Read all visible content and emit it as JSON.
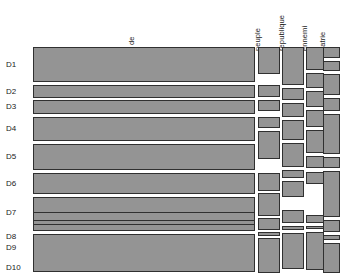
{
  "chart_data": {
    "type": "mosaic",
    "title": "",
    "subtitle": "",
    "xlabel": "",
    "ylabel": "",
    "grid": false,
    "legend": "none",
    "note": "Mosaic / marimekko style plot: column widths proportional to total word frequency; within each column, cell heights proportional to the frequency of that word in each document (D1..D10). Values are estimated from pixel geometry.",
    "row_categories": [
      "D1",
      "D2",
      "D3",
      "D4",
      "D5",
      "D6",
      "D7",
      "D8",
      "D9",
      "D10"
    ],
    "column_categories": [
      "de",
      "peuple",
      "republique",
      "ennemi",
      "patrie"
    ],
    "column_widths_px": [
      222,
      22,
      22,
      18,
      18
    ],
    "plot_area": {
      "x": 33,
      "y": 46,
      "width": 307,
      "height": 230
    },
    "series": [
      {
        "name": "de",
        "x": 33,
        "width": 222,
        "values": [
          33,
          12,
          14,
          23,
          25,
          20,
          31,
          9,
          7,
          37
        ],
        "cells": [
          {
            "row": "D1",
            "y": 47,
            "height": 35
          },
          {
            "row": "D2",
            "y": 85,
            "height": 13
          },
          {
            "row": "D3",
            "y": 100,
            "height": 14
          },
          {
            "row": "D4",
            "y": 117,
            "height": 24
          },
          {
            "row": "D5",
            "y": 144,
            "height": 26
          },
          {
            "row": "D6",
            "y": 173,
            "height": 21
          },
          {
            "row": "D7",
            "y": 197,
            "height": 32
          },
          {
            "row": "D8",
            "y": 212,
            "height": 9
          },
          {
            "row": "D9",
            "y": 224,
            "height": 7
          },
          {
            "row": "D10",
            "y": 234,
            "height": 38
          }
        ]
      },
      {
        "name": "peuple",
        "x": 258,
        "width": 22,
        "values": [
          26,
          11,
          10,
          10,
          27,
          17,
          22,
          11,
          3,
          33
        ],
        "cells": [
          {
            "row": "D1",
            "y": 47,
            "height": 27
          },
          {
            "row": "D2",
            "y": 85,
            "height": 12
          },
          {
            "row": "D3",
            "y": 100,
            "height": 11
          },
          {
            "row": "D4",
            "y": 117,
            "height": 11
          },
          {
            "row": "D5",
            "y": 131,
            "height": 28
          },
          {
            "row": "D6",
            "y": 173,
            "height": 18
          },
          {
            "row": "D7",
            "y": 193,
            "height": 23
          },
          {
            "row": "D8",
            "y": 218,
            "height": 12
          },
          {
            "row": "D9",
            "y": 232,
            "height": 4
          },
          {
            "row": "D10",
            "y": 238,
            "height": 35
          }
        ]
      },
      {
        "name": "republique",
        "x": 282,
        "width": 22,
        "values": [
          36,
          11,
          13,
          19,
          23,
          7,
          15,
          12,
          3,
          34
        ],
        "cells": [
          {
            "row": "D1",
            "y": 47,
            "height": 38
          },
          {
            "row": "D2",
            "y": 88,
            "height": 12
          },
          {
            "row": "D3",
            "y": 103,
            "height": 14
          },
          {
            "row": "D4",
            "y": 120,
            "height": 20
          },
          {
            "row": "D5",
            "y": 143,
            "height": 24
          },
          {
            "row": "D6",
            "y": 170,
            "height": 8
          },
          {
            "row": "D7",
            "y": 181,
            "height": 16
          },
          {
            "row": "D8",
            "y": 210,
            "height": 13
          },
          {
            "row": "D9",
            "y": 226,
            "height": 4
          },
          {
            "row": "D10",
            "y": 233,
            "height": 36
          }
        ]
      },
      {
        "name": "ennemi",
        "x": 306,
        "width": 18,
        "values": [
          22,
          14,
          15,
          16,
          22,
          11,
          11,
          7,
          2,
          36
        ],
        "cells": [
          {
            "row": "D1",
            "y": 47,
            "height": 23
          },
          {
            "row": "D2",
            "y": 73,
            "height": 15
          },
          {
            "row": "D3",
            "y": 91,
            "height": 16
          },
          {
            "row": "D4",
            "y": 110,
            "height": 17
          },
          {
            "row": "D5",
            "y": 130,
            "height": 23
          },
          {
            "row": "D6",
            "y": 156,
            "height": 12
          },
          {
            "row": "D7",
            "y": 172,
            "height": 12
          },
          {
            "row": "D8",
            "y": 215,
            "height": 8
          },
          {
            "row": "D9",
            "y": 226,
            "height": 3
          },
          {
            "row": "D10",
            "y": 232,
            "height": 38
          }
        ]
      },
      {
        "name": "patrie",
        "x": 323,
        "width": 17,
        "values": [
          10,
          9,
          20,
          12,
          38,
          10,
          44,
          11,
          4,
          28
        ],
        "cells": [
          {
            "row": "D1",
            "y": 47,
            "height": 11
          },
          {
            "row": "D2",
            "y": 61,
            "height": 10
          },
          {
            "row": "D3",
            "y": 74,
            "height": 21
          },
          {
            "row": "D4",
            "y": 98,
            "height": 13
          },
          {
            "row": "D5",
            "y": 114,
            "height": 40
          },
          {
            "row": "D6",
            "y": 157,
            "height": 11
          },
          {
            "row": "D7",
            "y": 171,
            "height": 46
          },
          {
            "row": "D8",
            "y": 220,
            "height": 12
          },
          {
            "row": "D9",
            "y": 235,
            "height": 5
          },
          {
            "row": "D10",
            "y": 243,
            "height": 30
          }
        ]
      }
    ]
  },
  "column_headers": [
    {
      "id": "de",
      "label": "de",
      "left": 136,
      "bottom": 36,
      "rotated": true
    },
    {
      "id": "peuple",
      "label": "peuple",
      "left": 262,
      "bottom": 42,
      "rotated": true
    },
    {
      "id": "republique",
      "label": "republique",
      "left": 286,
      "bottom": 42,
      "rotated": true
    },
    {
      "id": "ennemi",
      "label": "ennemi",
      "left": 309,
      "bottom": 42,
      "rotated": true
    },
    {
      "id": "patrie",
      "label": "patrie",
      "left": 327,
      "bottom": 42,
      "rotated": true
    }
  ],
  "row_headers": [
    {
      "id": "D1",
      "label": "D1",
      "top": 60
    },
    {
      "id": "D2",
      "label": "D2",
      "top": 87
    },
    {
      "id": "D3",
      "label": "D3",
      "top": 102
    },
    {
      "id": "D4",
      "label": "D4",
      "top": 124
    },
    {
      "id": "D5",
      "label": "D5",
      "top": 152
    },
    {
      "id": "D6",
      "label": "D6",
      "top": 179
    },
    {
      "id": "D7",
      "label": "D7",
      "top": 208
    },
    {
      "id": "D8",
      "label": "D8",
      "top": 232
    },
    {
      "id": "D9",
      "label": "D9",
      "top": 243
    },
    {
      "id": "D10",
      "label": "D10",
      "top": 263
    }
  ],
  "style": {
    "fill": "#949494",
    "stroke": "#303030",
    "background": "#ffffff",
    "text": "#1a1a1a"
  }
}
